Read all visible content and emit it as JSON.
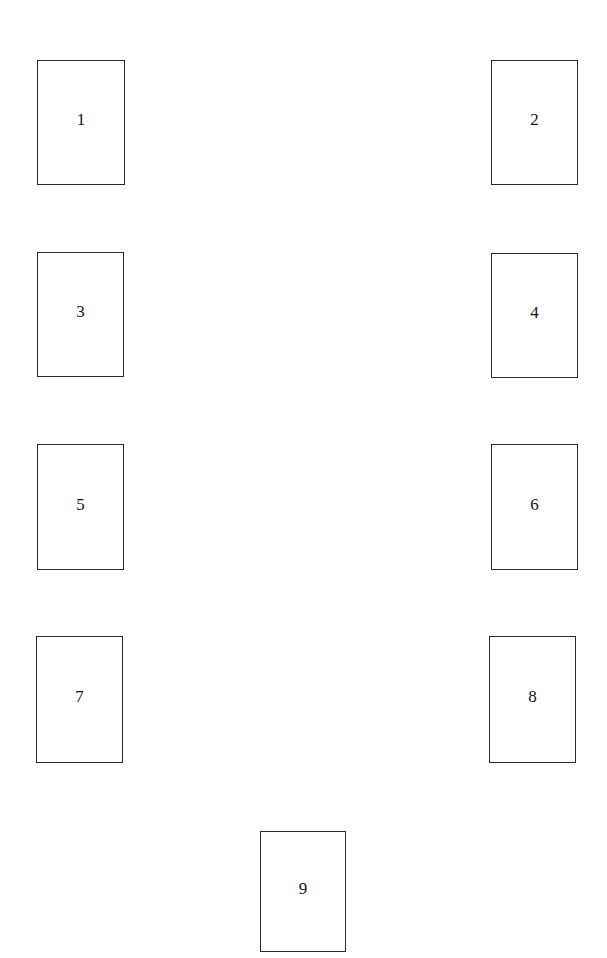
{
  "figure": {
    "background_color": "#ffffff",
    "border_color": "#2b2b2b",
    "label_color": "#141414",
    "canvas": {
      "width": 607,
      "height": 958
    },
    "layout_description": "nine empty rectangular panels, four in a left column, four in a right column, one centred below",
    "panels": [
      {
        "id": "panel-1",
        "label": "1",
        "x": 37,
        "y": 60,
        "w": 88,
        "h": 125
      },
      {
        "id": "panel-2",
        "label": "2",
        "x": 491,
        "y": 60,
        "w": 87,
        "h": 125
      },
      {
        "id": "panel-3",
        "label": "3",
        "x": 37,
        "y": 252,
        "w": 87,
        "h": 125
      },
      {
        "id": "panel-4",
        "label": "4",
        "x": 491,
        "y": 253,
        "w": 87,
        "h": 125
      },
      {
        "id": "panel-5",
        "label": "5",
        "x": 37,
        "y": 444,
        "w": 87,
        "h": 126
      },
      {
        "id": "panel-6",
        "label": "6",
        "x": 491,
        "y": 444,
        "w": 87,
        "h": 126
      },
      {
        "id": "panel-7",
        "label": "7",
        "x": 36,
        "y": 636,
        "w": 87,
        "h": 127
      },
      {
        "id": "panel-8",
        "label": "8",
        "x": 489,
        "y": 636,
        "w": 87,
        "h": 127
      },
      {
        "id": "panel-9",
        "label": "9",
        "x": 260,
        "y": 831,
        "w": 86,
        "h": 121
      }
    ]
  }
}
